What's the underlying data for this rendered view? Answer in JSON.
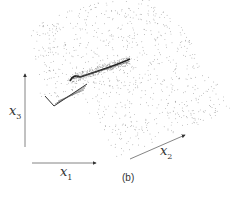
{
  "figure": {
    "caption": "(b)",
    "axes": {
      "x1": {
        "symbol": "x",
        "subscript": "1"
      },
      "x2": {
        "symbol": "x",
        "subscript": "2"
      },
      "x3": {
        "symbol": "x",
        "subscript": "3"
      }
    },
    "colors": {
      "points": "#8a8a8a",
      "fold": "#222222",
      "axis": "#555555"
    }
  }
}
